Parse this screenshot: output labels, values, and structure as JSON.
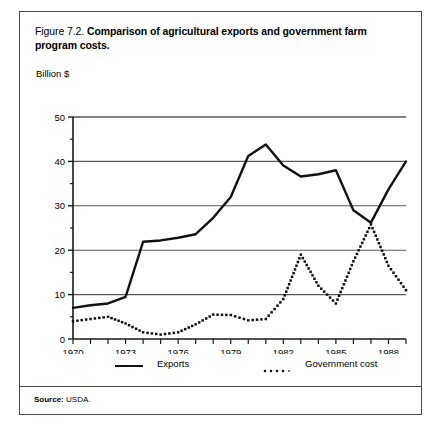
{
  "figure": {
    "number": "Figure 7.2.",
    "title": "Comparison of agricultural exports and government farm program costs.",
    "source_label": "Source:",
    "source_value": "USDA."
  },
  "chart_data": {
    "type": "line",
    "title": "Comparison of agricultural exports and government farm program costs.",
    "xlabel": "",
    "ylabel": "Billion $",
    "xlim": [
      1970,
      1989
    ],
    "ylim": [
      0,
      50
    ],
    "yticks": [
      0,
      10,
      20,
      30,
      40,
      50
    ],
    "ytick_labels": [
      "0",
      "10",
      "20",
      "30",
      "40",
      "50"
    ],
    "y_minor_ticks": [
      5,
      15,
      25,
      35,
      45
    ],
    "gridlines": [
      10,
      20,
      30,
      40,
      50
    ],
    "grid": true,
    "xticks": [
      1970,
      1971,
      1972,
      1973,
      1974,
      1975,
      1976,
      1977,
      1978,
      1979,
      1980,
      1981,
      1982,
      1983,
      1984,
      1985,
      1986,
      1987,
      1988,
      1989
    ],
    "xtick_labels": [
      "1970",
      "",
      "",
      "1973",
      "",
      "",
      "1976",
      "",
      "",
      "1979",
      "",
      "",
      "1982",
      "",
      "",
      "1985",
      "",
      "",
      "1988",
      ""
    ],
    "legend_position": "below",
    "x": [
      1970,
      1971,
      1972,
      1973,
      1974,
      1975,
      1976,
      1977,
      1978,
      1979,
      1980,
      1981,
      1982,
      1983,
      1984,
      1985,
      1986,
      1987,
      1988,
      1989
    ],
    "series": [
      {
        "name": "Exports",
        "style": "solid",
        "color": "#111111",
        "values": [
          7.0,
          7.6,
          8.0,
          9.5,
          21.9,
          22.2,
          22.8,
          23.6,
          27.3,
          32.0,
          41.2,
          43.8,
          39.1,
          36.6,
          37.1,
          38.0,
          29.0,
          26.2,
          33.7,
          40.0
        ]
      },
      {
        "name": "Government cost",
        "style": "dotted",
        "color": "#111111",
        "values": [
          4.0,
          4.5,
          5.0,
          3.5,
          1.5,
          1.0,
          1.5,
          3.3,
          5.5,
          5.4,
          4.2,
          4.5,
          9.0,
          19.0,
          12.0,
          8.0,
          17.5,
          25.8,
          16.5,
          11.0
        ]
      }
    ],
    "legend": [
      {
        "label": "Exports",
        "style": "solid"
      },
      {
        "label": "Government cost",
        "style": "dotted"
      }
    ]
  }
}
